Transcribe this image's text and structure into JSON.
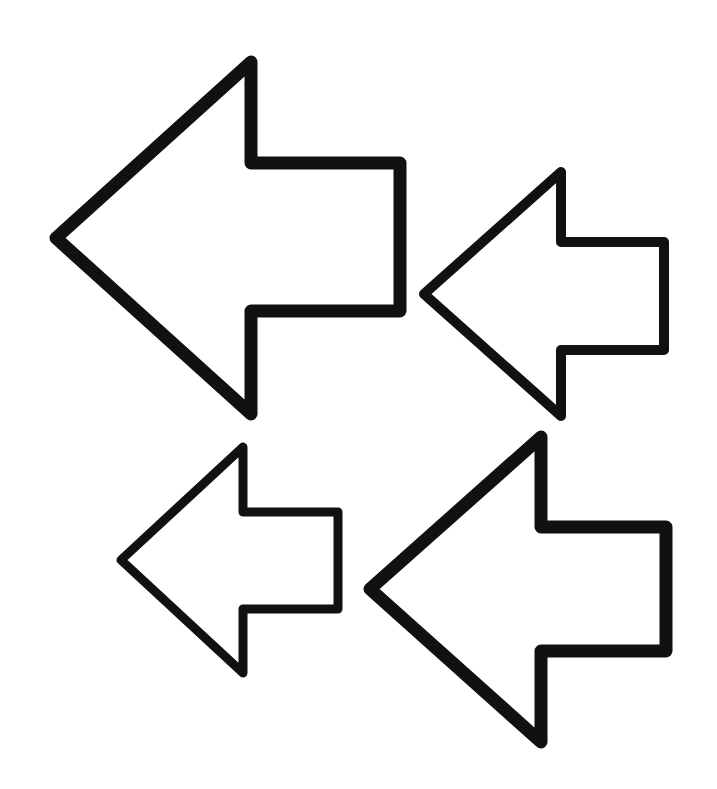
{
  "canvas": {
    "width": 717,
    "height": 789,
    "background": "#ffffff"
  },
  "arrows": [
    {
      "name": "large-left-arrow-top",
      "direction": "left",
      "stroke_color": "#111111",
      "stroke_width": 13,
      "points": "56,238 251,62 251,163 400,163 400,311 251,311 251,414"
    },
    {
      "name": "medium-left-arrow-top-right",
      "direction": "left",
      "stroke_color": "#111111",
      "stroke_width": 10,
      "points": "424,294 561,172 561,242 664,242 664,350 561,350 561,416"
    },
    {
      "name": "small-left-arrow-bottom-left",
      "direction": "left",
      "stroke_color": "#111111",
      "stroke_width": 9,
      "points": "121,560 243,447 243,512 338,512 338,609 243,609 243,673"
    },
    {
      "name": "large-left-arrow-bottom-right",
      "direction": "left",
      "stroke_color": "#111111",
      "stroke_width": 13,
      "points": "370,589 541,437 541,527 666,527 666,651 541,651 541,742"
    }
  ]
}
